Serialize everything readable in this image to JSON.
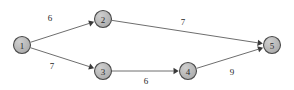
{
  "figure": {
    "background_color": "#ffffff",
    "width": 294,
    "height": 90
  },
  "style": {
    "node_fill": "#b3b3b3",
    "node_stroke": "#4a4a4a",
    "node_radius": 8.5,
    "node_label_color": "#2b2b2b",
    "edge_color": "#6e6e6e",
    "arrow_color": "#3a3a3a",
    "weight_color": "#262626"
  },
  "chart_data": {
    "type": "diagram",
    "diagram_kind": "directed-weighted-graph",
    "title": "",
    "directed": true,
    "weighted": true,
    "nodes": [
      {
        "id": "1",
        "label": "1",
        "x": 22,
        "y": 45
      },
      {
        "id": "2",
        "label": "2",
        "x": 103,
        "y": 19
      },
      {
        "id": "3",
        "label": "3",
        "x": 103,
        "y": 71
      },
      {
        "id": "4",
        "label": "4",
        "x": 188,
        "y": 71
      },
      {
        "id": "5",
        "label": "5",
        "x": 272,
        "y": 45
      }
    ],
    "edges": [
      {
        "from": "1",
        "to": "2",
        "weight": 6,
        "label": "6",
        "label_x": 50,
        "label_y": 18
      },
      {
        "from": "1",
        "to": "3",
        "weight": 7,
        "label": "7",
        "label_x": 52,
        "label_y": 66
      },
      {
        "from": "2",
        "to": "5",
        "weight": 7,
        "label": "7",
        "label_x": 183,
        "label_y": 22
      },
      {
        "from": "3",
        "to": "4",
        "weight": 6,
        "label": "6",
        "label_x": 146,
        "label_y": 81
      },
      {
        "from": "4",
        "to": "5",
        "weight": 9,
        "label": "9",
        "label_x": 232,
        "label_y": 72
      }
    ]
  }
}
